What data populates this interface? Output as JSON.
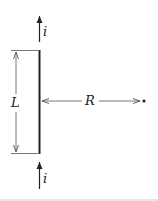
{
  "diagram": {
    "labels": {
      "current_top": "i",
      "current_bottom": "i",
      "length": "L",
      "distance": "R"
    },
    "colors": {
      "ink": "#222222",
      "dimension": "#555555",
      "background": "#ffffff",
      "rule": "#e6e6e6"
    }
  }
}
